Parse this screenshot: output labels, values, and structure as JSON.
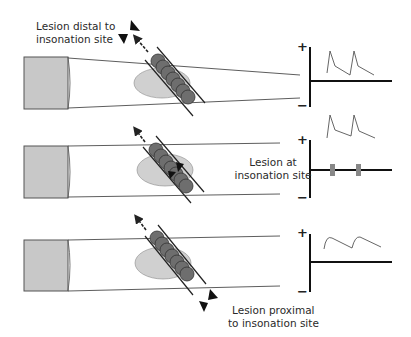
{
  "figure": {
    "panels": [
      {
        "id": "distal",
        "label_line1": "Lesion distal to",
        "label_line2": "insonation site",
        "waveform": "normal spiked systolic peaks",
        "plus": "+",
        "minus": "−"
      },
      {
        "id": "at-site",
        "label_line1": "Lesion at",
        "label_line2": "insonation site",
        "waveform": "bidirectional spikes with minimal flow on baseline",
        "plus": "+",
        "minus": "−"
      },
      {
        "id": "proximal",
        "label_line1": "Lesion proximal",
        "label_line2": "to insonation site",
        "waveform": "dampened rounded waveform",
        "plus": "+",
        "minus": "−"
      }
    ],
    "colors": {
      "probe_fill": "#c8c8c8",
      "probe_stroke": "#555555",
      "ellipse_fill": "#d0d0d0",
      "clot_fill": "#6e6e6e",
      "line": "#222222",
      "waveform": "#555555",
      "bar_fill": "#888888"
    }
  }
}
